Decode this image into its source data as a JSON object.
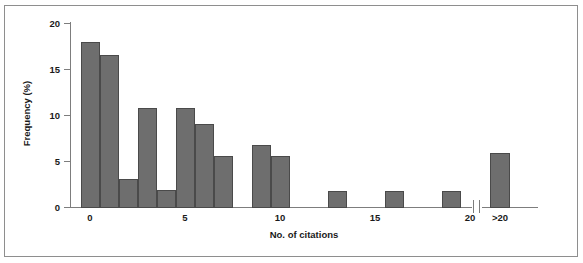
{
  "figure": {
    "background_color": "#ffffff",
    "frame_color": "#8e8e8e",
    "axis_color": "#7d7d7d",
    "bar_fill_color": "#6e6e6e",
    "bar_edge_color": "#4a4a4a"
  },
  "chart_data": {
    "type": "bar",
    "title": "",
    "subtitle": "",
    "xlabel": "No. of citations",
    "ylabel": "Frequency (%)",
    "xlim": [
      -0.6,
      21.6
    ],
    "ylim": [
      0,
      20
    ],
    "grid": false,
    "legend": null,
    "axis_break": {
      "present": true,
      "between": [
        20,
        ">20"
      ],
      "symbol": "double-slash"
    },
    "y_ticks": [
      0,
      5,
      10,
      15,
      20
    ],
    "y_tick_labels": [
      "0",
      "5",
      "10",
      "15",
      "20"
    ],
    "x_ticks": [
      0,
      5,
      10,
      15,
      20,
      21
    ],
    "x_tick_labels": [
      "0",
      "5",
      "10",
      "15",
      "20",
      ">20"
    ],
    "categories": [
      "0",
      "1",
      "2",
      "3",
      "4",
      "5",
      "6",
      "7",
      "8",
      "9",
      "10",
      "11",
      "12",
      "13",
      "14",
      "15",
      "16",
      "17",
      "18",
      "19",
      "20",
      ">20"
    ],
    "values": [
      18.0,
      16.6,
      3.2,
      10.9,
      2.0,
      10.9,
      9.1,
      5.7,
      0,
      6.9,
      5.7,
      0,
      0,
      1.8,
      0,
      0,
      1.9,
      0,
      0,
      1.8,
      0,
      6.0
    ],
    "bars": [
      {
        "x": 0,
        "label": "0",
        "value": 18.0
      },
      {
        "x": 1,
        "label": "1",
        "value": 16.6
      },
      {
        "x": 2,
        "label": "2",
        "value": 3.2
      },
      {
        "x": 3,
        "label": "3",
        "value": 10.9
      },
      {
        "x": 4,
        "label": "4",
        "value": 2.0
      },
      {
        "x": 5,
        "label": "5",
        "value": 10.9
      },
      {
        "x": 6,
        "label": "6",
        "value": 9.1
      },
      {
        "x": 7,
        "label": "7",
        "value": 5.7
      },
      {
        "x": 9,
        "label": "9",
        "value": 6.9
      },
      {
        "x": 10,
        "label": "10",
        "value": 5.7
      },
      {
        "x": 13,
        "label": "13",
        "value": 1.8
      },
      {
        "x": 16,
        "label": "16",
        "value": 1.9
      },
      {
        "x": 19,
        "label": "19",
        "value": 1.8
      },
      {
        "x": 21,
        "label": ">20",
        "value": 6.0
      }
    ]
  }
}
